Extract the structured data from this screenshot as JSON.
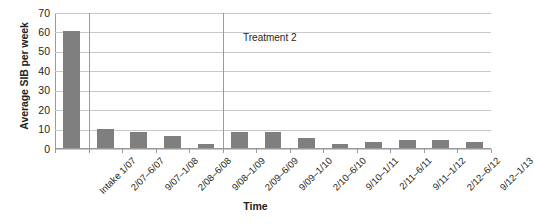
{
  "chart_data": {
    "type": "bar",
    "title": "",
    "xlabel": "Time",
    "ylabel": "Average SIB per week",
    "ylim": [
      0,
      70
    ],
    "ytick_step": 10,
    "yticks": [
      70,
      60,
      50,
      40,
      30,
      20,
      10,
      0
    ],
    "grid": true,
    "legend": "none",
    "bar_color": "#7f7f7f",
    "gridline_color": "#c9c9c9",
    "axis_color": "#9a9a9a",
    "categories": [
      "Intake 1/07",
      "2/07–6/07",
      "9/07–1/08",
      "2/08–6/08",
      "9/08–1/09",
      "2/09–6/09",
      "9/09–1/10",
      "2/10–6/10",
      "9/10–1/11",
      "2/11–6/11",
      "9/11–1/12",
      "2/12–6/12",
      "9/12–1/13"
    ],
    "values": [
      60,
      10,
      8,
      6,
      2,
      8,
      8,
      5,
      2,
      3,
      4,
      4,
      3
    ],
    "annotations": [
      {
        "text": "Treatment 2",
        "x_category": "9/09–1/10",
        "y_value": 57
      }
    ],
    "phase_dividers": [
      {
        "after_category": "Intake 1/07"
      },
      {
        "after_category": "9/08–1/09"
      }
    ]
  }
}
